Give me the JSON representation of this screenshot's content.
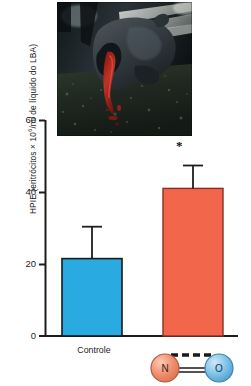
{
  "figure": {
    "photo": {
      "name": "horse-head-epistaxis-photo",
      "caption_text": "",
      "alt_description": "Fotografia de cavalo com epistaxe (sangramento nasal) apos exercicio"
    },
    "axis": {
      "y_title": "HPIE (eritrócitos × 10",
      "y_title_sup": "6",
      "y_title_rest": "/m",
      "y_title_ital": "l",
      "y_title_tail": " de líquido do LBA)",
      "y_title_full": "HPIE (eritrócitos × 10⁶/ml de líquido do LBA)",
      "y_ticks": [
        "60",
        "40",
        "20",
        "0"
      ],
      "y_min": 0,
      "y_max": 60
    },
    "x_labels": {
      "control": "Controle",
      "treatment_atom_left": "N",
      "treatment_atom_right": "O"
    },
    "significance_marker": "*",
    "colors": {
      "control_bar": "#29ABE2",
      "treatment_bar": "#F2664C",
      "bar_outline": "#1a1a1a",
      "axis": "#1d1d1d",
      "atom_n": "#F0906F",
      "atom_o": "#7FC3E8"
    }
  },
  "chart_data": {
    "type": "bar",
    "title": "",
    "subtitle": "",
    "xlabel": "",
    "ylabel": "HPIE (eritrócitos × 10⁶/ml de líquido do LBA)",
    "categories": [
      "Controle",
      "NO"
    ],
    "values": [
      21.5,
      41.0
    ],
    "errors": [
      9.0,
      6.5
    ],
    "error_type": "upper-only",
    "bar_colors": [
      "#29ABE2",
      "#F2664C"
    ],
    "annotations": [
      {
        "category": "NO",
        "text": "*",
        "meaning": "significativo"
      }
    ],
    "ylim": [
      0,
      60
    ],
    "yticks": [
      0,
      20,
      40,
      60
    ],
    "grid": false,
    "legend": "none"
  }
}
